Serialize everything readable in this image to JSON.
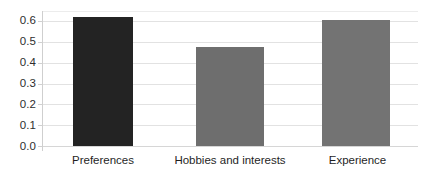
{
  "chart_data": {
    "type": "bar",
    "title": "",
    "subtitle": "",
    "xlabel": "",
    "ylabel": "",
    "categories": [
      "Preferences",
      "Hobbies and interests",
      "Experience"
    ],
    "values": [
      0.62,
      0.475,
      0.605
    ],
    "series": [
      {
        "name": "",
        "values": [
          0.62,
          0.475,
          0.605
        ]
      }
    ],
    "bar_colors": [
      "#232323",
      "#6e6e6e",
      "#737373"
    ],
    "ylim": [
      0.0,
      0.65
    ],
    "ytick_values": [
      0.0,
      0.1,
      0.2,
      0.3,
      0.4,
      0.5,
      0.6
    ],
    "ytick_labels": [
      "0.0",
      "0.1",
      "0.2",
      "0.3",
      "0.4",
      "0.5",
      "0.6"
    ],
    "grid": true,
    "grid_axis": "y",
    "grid_color": "#e2e2e2",
    "legend": false,
    "legend_position": "none",
    "annotations": [],
    "background_color": "#ffffff",
    "axis_line_color": "#cfcfcf"
  },
  "axis": {
    "ticks": [
      {
        "label": "0.6",
        "value": 0.6
      },
      {
        "label": "0.5",
        "value": 0.5
      },
      {
        "label": "0.4",
        "value": 0.4
      },
      {
        "label": "0.3",
        "value": 0.3
      },
      {
        "label": "0.2",
        "value": 0.2
      },
      {
        "label": "0.1",
        "value": 0.1
      },
      {
        "label": "0.0",
        "value": 0.0
      }
    ]
  },
  "bars": [
    {
      "label": "Preferences",
      "value": 0.62,
      "color": "#232323"
    },
    {
      "label": "Hobbies and interests",
      "value": 0.475,
      "color": "#6e6e6e"
    },
    {
      "label": "Experience",
      "value": 0.605,
      "color": "#737373"
    }
  ]
}
